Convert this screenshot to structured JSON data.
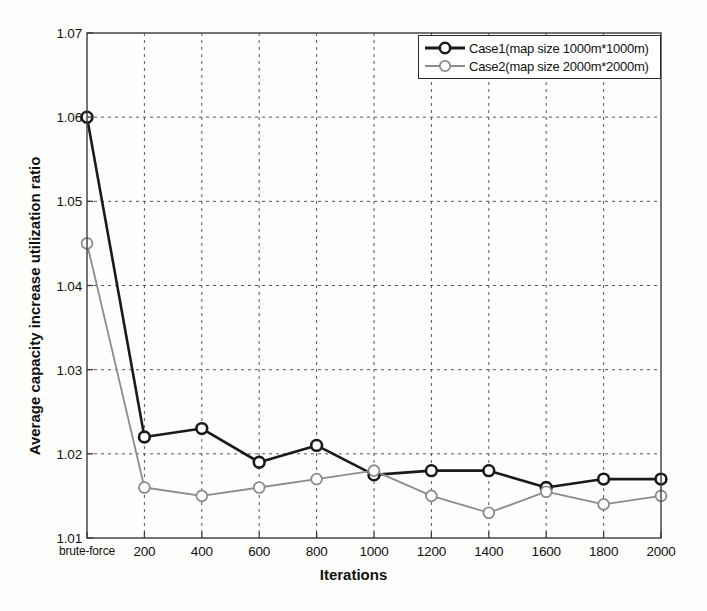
{
  "chart_data": {
    "type": "line",
    "title": "",
    "xlabel": "Iterations",
    "ylabel": "Average capacity increase utilization ratio",
    "categories": [
      "brute-force",
      "200",
      "400",
      "600",
      "800",
      "1000",
      "1200",
      "1400",
      "1600",
      "1800",
      "2000"
    ],
    "xtick_labels": [
      "brute-force",
      "200",
      "400",
      "600",
      "800",
      "1000",
      "1200",
      "1400",
      "1600",
      "1800",
      "2000"
    ],
    "ytick_labels": [
      "1.01",
      "1.02",
      "1.03",
      "1.04",
      "1.05",
      "1.06",
      "1.07"
    ],
    "ylim": [
      1.01,
      1.07
    ],
    "ytick_values": [
      1.01,
      1.02,
      1.03,
      1.04,
      1.05,
      1.06,
      1.07
    ],
    "grid": true,
    "grid_style": "dashed",
    "legend_position": "top-right",
    "series": [
      {
        "name": "Case1(map size 1000m*1000m)",
        "color": "#1a1a1a",
        "marker": "circle",
        "line_width": 2.6,
        "values": [
          1.06,
          1.022,
          1.023,
          1.019,
          1.021,
          1.0175,
          1.018,
          1.018,
          1.016,
          1.017,
          1.017
        ]
      },
      {
        "name": "Case2(map size 2000m*2000m)",
        "color": "#8c8c8c",
        "marker": "circle",
        "line_width": 1.8,
        "values": [
          1.045,
          1.016,
          1.015,
          1.016,
          1.017,
          1.018,
          1.015,
          1.013,
          1.0155,
          1.014,
          1.015
        ]
      }
    ]
  },
  "legend": {
    "items": [
      {
        "label": "Case1(map size 1000m*1000m)",
        "color": "#1a1a1a"
      },
      {
        "label": "Case2(map size 2000m*2000m)",
        "color": "#8c8c8c"
      }
    ]
  },
  "axes": {
    "x_title": "Iterations",
    "y_title": "Average capacity increase utilization ratio"
  },
  "colors": {
    "case1": "#1a1a1a",
    "case2": "#8c8c8c",
    "grid": "#555555",
    "axis": "#3a3a3a",
    "background": "#fefefd"
  }
}
